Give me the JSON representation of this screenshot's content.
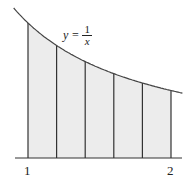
{
  "figure": {
    "equation": {
      "lhs": "y =",
      "numerator": "1",
      "denominator": "x"
    },
    "x_labels": [
      {
        "text": "1",
        "value": 1
      },
      {
        "text": "2",
        "value": 2
      }
    ],
    "strip_edges": [
      1,
      1.2,
      1.4,
      1.6,
      1.8,
      2
    ],
    "colors": {
      "fill": "#ececec",
      "line": "#333333",
      "curve": "#444444"
    }
  }
}
